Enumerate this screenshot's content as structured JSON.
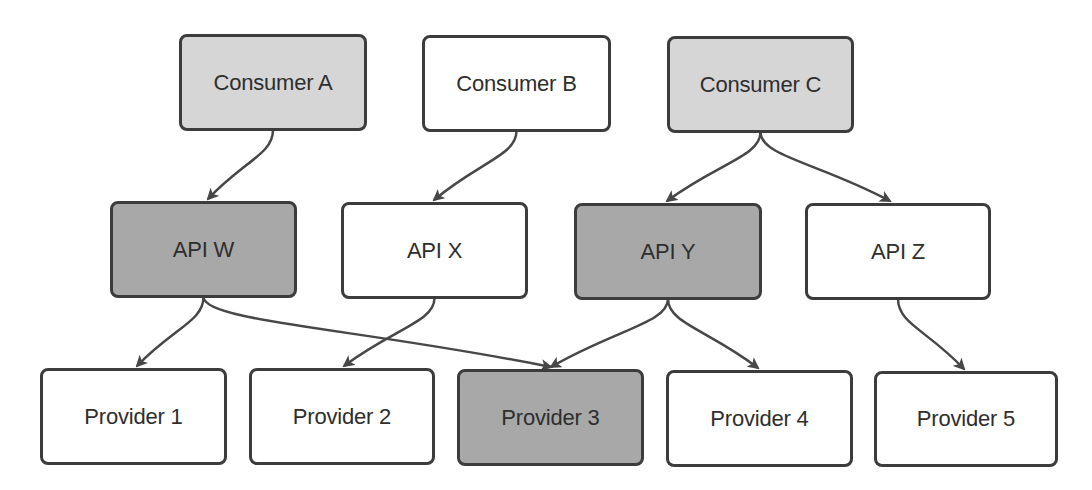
{
  "diagram": {
    "colors": {
      "border": "#3c3c3c",
      "edge": "#474747",
      "fill_light": "#d6d6d6",
      "fill_dark": "#a8a8a8",
      "fill_white": "#ffffff",
      "text": "#2e2e2e"
    },
    "nodes": [
      {
        "id": "consumer-a",
        "label": "Consumer A",
        "tier": "consumer",
        "fill": "light",
        "x": 179,
        "y": 34,
        "w": 188,
        "h": 97
      },
      {
        "id": "consumer-b",
        "label": "Consumer B",
        "tier": "consumer",
        "fill": "white",
        "x": 422,
        "y": 35,
        "w": 189,
        "h": 97
      },
      {
        "id": "consumer-c",
        "label": "Consumer C",
        "tier": "consumer",
        "fill": "light",
        "x": 667,
        "y": 36,
        "w": 187,
        "h": 97
      },
      {
        "id": "api-w",
        "label": "API W",
        "tier": "api",
        "fill": "dark",
        "x": 110,
        "y": 201,
        "w": 187,
        "h": 97
      },
      {
        "id": "api-x",
        "label": "API X",
        "tier": "api",
        "fill": "white",
        "x": 341,
        "y": 202,
        "w": 187,
        "h": 97
      },
      {
        "id": "api-y",
        "label": "API Y",
        "tier": "api",
        "fill": "dark",
        "x": 574,
        "y": 203,
        "w": 188,
        "h": 97
      },
      {
        "id": "api-z",
        "label": "API Z",
        "tier": "api",
        "fill": "white",
        "x": 805,
        "y": 203,
        "w": 186,
        "h": 97
      },
      {
        "id": "provider-1",
        "label": "Provider 1",
        "tier": "provider",
        "fill": "white",
        "x": 40,
        "y": 368,
        "w": 187,
        "h": 97
      },
      {
        "id": "provider-2",
        "label": "Provider 2",
        "tier": "provider",
        "fill": "white",
        "x": 249,
        "y": 368,
        "w": 186,
        "h": 97
      },
      {
        "id": "provider-3",
        "label": "Provider 3",
        "tier": "provider",
        "fill": "dark",
        "x": 457,
        "y": 369,
        "w": 187,
        "h": 97
      },
      {
        "id": "provider-4",
        "label": "Provider 4",
        "tier": "provider",
        "fill": "white",
        "x": 666,
        "y": 370,
        "w": 187,
        "h": 97
      },
      {
        "id": "provider-5",
        "label": "Provider 5",
        "tier": "provider",
        "fill": "white",
        "x": 874,
        "y": 371,
        "w": 184,
        "h": 96
      }
    ],
    "edges": [
      {
        "from": "consumer-a",
        "to": "api-w"
      },
      {
        "from": "consumer-b",
        "to": "api-x"
      },
      {
        "from": "consumer-c",
        "to": "api-y"
      },
      {
        "from": "consumer-c",
        "to": "api-z"
      },
      {
        "from": "api-w",
        "to": "provider-1"
      },
      {
        "from": "api-w",
        "to": "provider-3"
      },
      {
        "from": "api-x",
        "to": "provider-2"
      },
      {
        "from": "api-y",
        "to": "provider-3"
      },
      {
        "from": "api-y",
        "to": "provider-4"
      },
      {
        "from": "api-z",
        "to": "provider-5"
      }
    ]
  }
}
